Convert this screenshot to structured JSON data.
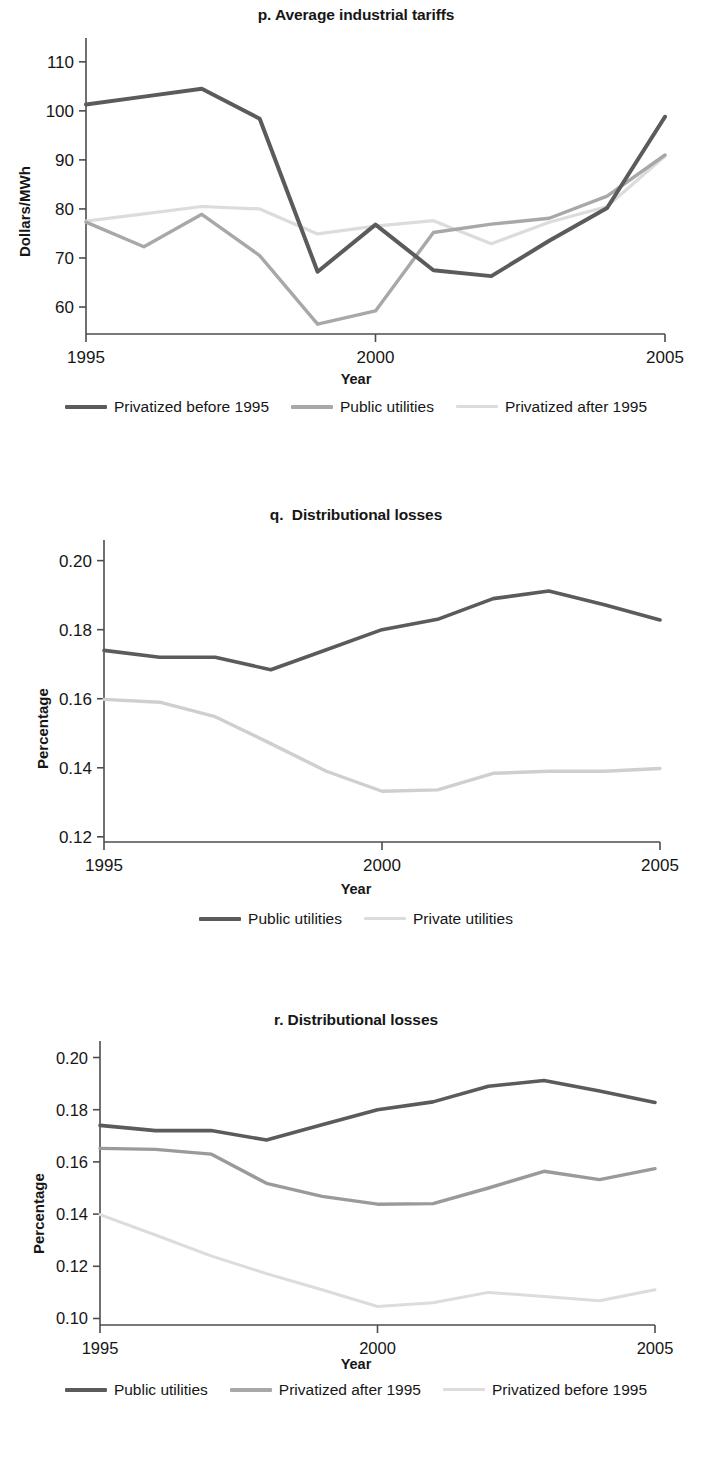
{
  "colors": {
    "dark": "#5b5b5b",
    "mid": "#a8a8a8",
    "light": "#dcdcdc",
    "axis": "#4d4d4d",
    "text": "#161616"
  },
  "panels": [
    {
      "id": "p",
      "title": "p. Average industrial tariffs",
      "legend": [
        {
          "label": "Privatized before 1995",
          "color_key": "dark"
        },
        {
          "label": "Public utilities",
          "color_key": "mid"
        },
        {
          "label": "Privatized after 1995",
          "color_key": "light"
        }
      ]
    },
    {
      "id": "q",
      "title": "q.  Distributional losses",
      "legend": [
        {
          "label": "Public utilities",
          "color_key": "dark"
        },
        {
          "label": "Private utilities",
          "color_key": "light"
        }
      ]
    },
    {
      "id": "r",
      "title": "r. Distributional losses",
      "legend": [
        {
          "label": "Public utilities",
          "color_key": "dark"
        },
        {
          "label": "Privatized after 1995",
          "color_key": "mid"
        },
        {
          "label": "Privatized before 1995",
          "color_key": "light"
        }
      ]
    }
  ],
  "chart_data": [
    {
      "type": "line",
      "id": "p",
      "title": "p. Average industrial tariffs",
      "xlabel": "Year",
      "ylabel": "Dollars/MWh",
      "x": [
        1995,
        1996,
        1997,
        1998,
        1999,
        2000,
        2001,
        2002,
        2003,
        2004,
        2005
      ],
      "xticks": [
        1995,
        2000,
        2005
      ],
      "xticklabels": [
        "1995",
        "2000",
        "2005"
      ],
      "xlim": [
        1995,
        2005
      ],
      "yticks": [
        60,
        70,
        80,
        90,
        100,
        110
      ],
      "yticklabels": [
        "60",
        "70",
        "80",
        "90",
        "100",
        "110"
      ],
      "ylim": [
        54.5,
        112
      ],
      "grid": false,
      "legend_position": "below",
      "series": [
        {
          "name": "Privatized before 1995",
          "color": "#5b5b5b",
          "width": 4.0,
          "values": [
            101.3,
            102.9,
            104.5,
            98.4,
            67.2,
            76.8,
            67.5,
            66.3,
            73.5,
            80.2,
            98.8
          ]
        },
        {
          "name": "Public utilities",
          "color": "#a8a8a8",
          "width": 3.4,
          "values": [
            77.3,
            72.3,
            78.9,
            70.5,
            56.5,
            59.2,
            75.2,
            76.9,
            78.1,
            82.6,
            91.0
          ]
        },
        {
          "name": "Privatized after 1995",
          "color": "#dcdcdc",
          "width": 3.2,
          "values": [
            77.5,
            79.0,
            80.5,
            80.0,
            74.9,
            76.5,
            77.6,
            72.9,
            77.3,
            80.5,
            90.8
          ]
        }
      ]
    },
    {
      "type": "line",
      "id": "q",
      "title": "q.  Distributional losses",
      "xlabel": "Year",
      "ylabel": "Percentage",
      "x": [
        1995,
        1996,
        1997,
        1998,
        1999,
        2000,
        2001,
        2002,
        2003,
        2004,
        2005
      ],
      "xticks": [
        1995,
        2000,
        2005
      ],
      "xticklabels": [
        "1995",
        "2000",
        "2005"
      ],
      "xlim": [
        1995,
        2005
      ],
      "yticks": [
        0.12,
        0.14,
        0.16,
        0.18,
        0.2
      ],
      "yticklabels": [
        "0.12",
        "0.14",
        "0.16",
        "0.18",
        "0.20"
      ],
      "ylim": [
        0.1185,
        0.2025
      ],
      "grid": false,
      "legend_position": "below",
      "series": [
        {
          "name": "Public utilities",
          "color": "#5b5b5b",
          "width": 3.6,
          "values": [
            0.174,
            0.172,
            0.172,
            0.1684,
            0.1742,
            0.18,
            0.183,
            0.189,
            0.1912,
            0.1872,
            0.1828
          ]
        },
        {
          "name": "Private utilities",
          "color": "#cfcfcf",
          "width": 3.4,
          "values": [
            0.1598,
            0.159,
            0.1548,
            0.147,
            0.139,
            0.1332,
            0.1336,
            0.1384,
            0.139,
            0.139,
            0.1398
          ]
        }
      ]
    },
    {
      "type": "line",
      "id": "r",
      "title": "r. Distributional losses",
      "xlabel": "Year",
      "ylabel": "Percentage",
      "x": [
        1995,
        1996,
        1997,
        1998,
        1999,
        2000,
        2001,
        2002,
        2003,
        2004,
        2005
      ],
      "xticks": [
        1995,
        2000,
        2005
      ],
      "xticklabels": [
        "1995",
        "2000",
        "2005"
      ],
      "xlim": [
        1995,
        2005
      ],
      "yticks": [
        0.1,
        0.12,
        0.14,
        0.16,
        0.18,
        0.2
      ],
      "yticklabels": [
        "0.10",
        "0.12",
        "0.14",
        "0.16",
        "0.18",
        "0.20"
      ],
      "ylim": [
        0.0975,
        0.2025
      ],
      "grid": false,
      "legend_position": "below",
      "series": [
        {
          "name": "Public utilities",
          "color": "#5b5b5b",
          "width": 3.6,
          "values": [
            0.174,
            0.172,
            0.172,
            0.1684,
            0.1742,
            0.18,
            0.183,
            0.189,
            0.1912,
            0.1872,
            0.1828
          ]
        },
        {
          "name": "Privatized after 1995",
          "color": "#9a9a9a",
          "width": 3.4,
          "values": [
            0.1652,
            0.1648,
            0.163,
            0.1518,
            0.1468,
            0.1438,
            0.144,
            0.15,
            0.1564,
            0.1532,
            0.1574
          ]
        },
        {
          "name": "Privatized before 1995",
          "color": "#dcdcdc",
          "width": 3.0,
          "values": [
            0.1398,
            0.132,
            0.124,
            0.1172,
            0.111,
            0.1046,
            0.106,
            0.11,
            0.1084,
            0.1068,
            0.111
          ]
        }
      ]
    }
  ]
}
